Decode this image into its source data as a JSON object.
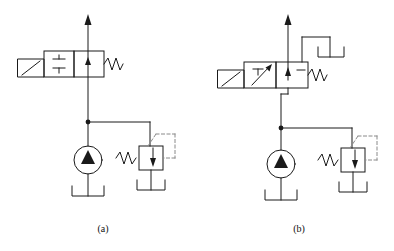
{
  "figure": {
    "background_color": "#ffffff",
    "line_color": "#1a1a1a",
    "dashed_line_color": "#7a7a7a",
    "fill_color": "#000000",
    "panel_count": 2
  },
  "panels": [
    {
      "id": "panel-a",
      "caption": "(a)",
      "description": "Two-position two-way solenoid valve with pump and pressure relief valve",
      "components": [
        {
          "name": "directional-control-valve",
          "type": "2-position 2-way valve",
          "positions": 2,
          "left_box": {
            "symbol": "diagonal-flow-arrow",
            "description": "parallelogram actuator box with diagonal line"
          },
          "center_box": {
            "symbol": "closed-center-blocked",
            "description": "two horizontal bars indicating blocked / capacitor-like symbol"
          },
          "right_box": {
            "symbol": "up-arrow-flow",
            "description": "vertical arrow pointing up indicating open flow path"
          },
          "spring_return": "right side zigzag spring"
        },
        {
          "name": "hydraulic-pump",
          "type": "fixed displacement pump",
          "symbol": "circle with solid up triangle"
        },
        {
          "name": "pressure-relief-valve",
          "type": "relief valve",
          "symbol": "box with down arrow, spring on left, dashed pilot line on right"
        },
        {
          "name": "reservoir-pump",
          "type": "tank",
          "symbol": "open-top rectangle"
        },
        {
          "name": "reservoir-relief",
          "type": "tank",
          "symbol": "open-top rectangle"
        },
        {
          "name": "outlet-arrow",
          "type": "flow direction arrow",
          "direction": "up"
        },
        {
          "name": "junction-node",
          "type": "line junction dot"
        }
      ]
    },
    {
      "id": "panel-b",
      "caption": "(b)",
      "description": "Three-way solenoid valve with tank return line, pump and pressure relief valve",
      "components": [
        {
          "name": "directional-control-valve",
          "type": "2-position 3-way valve",
          "positions": 2,
          "left_box": {
            "symbol": "blocked-port-and-diagonal-arrow",
            "description": "T-shaped blocked port with diagonal arrow"
          },
          "right_box": {
            "symbol": "up-arrow-and-blocked-dash",
            "description": "vertical up arrow plus horizontal blocked dash"
          },
          "actuator_box": {
            "symbol": "diagonal-flow-arrow",
            "description": "parallelogram actuator box with diagonal line"
          },
          "spring_return": "right side zigzag spring"
        },
        {
          "name": "hydraulic-pump",
          "type": "fixed displacement pump",
          "symbol": "circle with solid up triangle"
        },
        {
          "name": "pressure-relief-valve",
          "type": "relief valve",
          "symbol": "box with down arrow, spring on left, dashed pilot line on right"
        },
        {
          "name": "reservoir-pump",
          "type": "tank",
          "symbol": "open-top rectangle"
        },
        {
          "name": "reservoir-relief",
          "type": "tank",
          "symbol": "open-top rectangle"
        },
        {
          "name": "reservoir-valve-return",
          "type": "tank",
          "symbol": "open-top rectangle fed by valve return line"
        },
        {
          "name": "outlet-arrow",
          "type": "flow direction arrow",
          "direction": "up"
        },
        {
          "name": "junction-node",
          "type": "line junction dot"
        }
      ]
    }
  ]
}
